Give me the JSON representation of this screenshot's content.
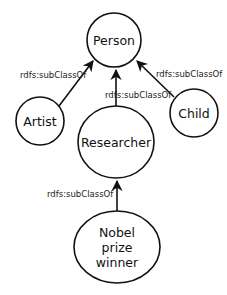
{
  "diagram": {
    "type": "class-hierarchy",
    "nodes": [
      {
        "id": "person",
        "label": "Person"
      },
      {
        "id": "artist",
        "label": "Artist"
      },
      {
        "id": "researcher",
        "label": "Researcher"
      },
      {
        "id": "child",
        "label": "Child"
      },
      {
        "id": "nobel",
        "label_lines": [
          "Nobel",
          "prize",
          "winner"
        ]
      }
    ],
    "edges": [
      {
        "from": "artist",
        "to": "person",
        "label": "rdfs:subClassOf"
      },
      {
        "from": "researcher",
        "to": "person",
        "label": "rdfs:subClassOf"
      },
      {
        "from": "child",
        "to": "person",
        "label": "rdfs:subClassOf"
      },
      {
        "from": "nobel",
        "to": "researcher",
        "label": "rdfs:subClassOf"
      }
    ]
  },
  "colors": {
    "stroke": "#111111",
    "background": "#ffffff"
  }
}
